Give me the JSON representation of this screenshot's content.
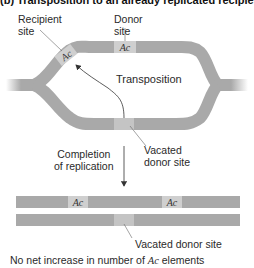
{
  "title": "(b)   Transposition to an already replicated recipient site",
  "labels": {
    "recipient_site_line1": "Recipient",
    "recipient_site_line2": "site",
    "donor_site_line1": "Donor",
    "donor_site_line2": "site",
    "transposition": "Transposition",
    "vacated_donor_site_line1": "Vacated",
    "vacated_donor_site_line2": "donor site",
    "completion_line1": "Completion",
    "completion_line2": "of replication",
    "vacated_donor_site_bottom": "Vacated donor site",
    "footer_prefix": "No net increase in number of ",
    "footer_element": "Ac",
    "footer_suffix": " elements"
  },
  "elements": {
    "recipient_ac": "Ac",
    "donor_ac": "Ac",
    "product_ac_1": "Ac",
    "product_ac_2": "Ac"
  },
  "colors": {
    "dna_strand": "#a9a9a9",
    "element_box": "#cfcfcf",
    "vacated_box": "#c4c4c4",
    "arrow": "#333333"
  }
}
